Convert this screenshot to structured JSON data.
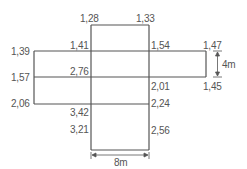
{
  "diagram": {
    "labels": {
      "tl_top": "1,28",
      "tr_top": "1,33",
      "left_top": "1,39",
      "inner_tl": "1,41",
      "inner_tr": "1,54",
      "right_top": "1,47",
      "left_mid": "1,57",
      "inner_ml": "2,76",
      "inner_mr": "2,01",
      "right_mid": "1,45",
      "left_bot": "2,06",
      "inner_bl": "3,42",
      "inner_br": "2,24",
      "bot_l": "3,21",
      "bot_r": "2,56"
    },
    "dimensions": {
      "height": "4m",
      "width": "8m"
    },
    "colors": {
      "line": "#555555",
      "text": "#555555"
    }
  }
}
